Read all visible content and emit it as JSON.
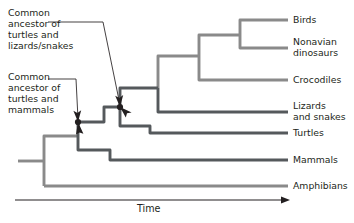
{
  "figure": {
    "background_color": "#ffffff",
    "text_color": "#231f20",
    "branch_color_light": "#8a8a8a",
    "branch_color_dark": "#55595c",
    "leader_color": "#231f20",
    "node_color": "#231f20"
  },
  "axis": {
    "label": "Time",
    "arrow_direction": "right",
    "x_start": 15,
    "x_end": 288,
    "y": 200
  },
  "tips": [
    {
      "name": "birds",
      "label": "Birds",
      "y": 20,
      "shade": "light"
    },
    {
      "name": "nonavian-dinosaurs",
      "label": "Nonavian\ndinosaurs",
      "y": 48,
      "shade": "light"
    },
    {
      "name": "crocodiles",
      "label": "Crocodiles",
      "y": 80,
      "shade": "light"
    },
    {
      "name": "lizards-and-snakes",
      "label": "Lizards\nand snakes",
      "y": 112,
      "shade": "dark"
    },
    {
      "name": "turtles",
      "label": "Turtles",
      "y": 133,
      "shade": "dark"
    },
    {
      "name": "mammals",
      "label": "Mammals",
      "y": 160,
      "shade": "dark"
    },
    {
      "name": "amphibians",
      "label": "Amphibians",
      "y": 186,
      "shade": "light"
    }
  ],
  "callouts": [
    {
      "name": "common-ancestor-turtles-lizards-snakes",
      "text": "Common\nancestor of\nturtles and\nlizards/snakes",
      "x": 8,
      "y": 8,
      "leader_y": 22,
      "leader_x_end": 103,
      "target_x": 120,
      "target_y": 107
    },
    {
      "name": "common-ancestor-turtles-mammals",
      "text": "Common\nancestor of\nturtles and\nmammals",
      "x": 8,
      "y": 72,
      "leader_y": 79,
      "leader_x_end": 76,
      "target_x": 78,
      "target_y": 122
    }
  ],
  "nodes": [
    {
      "name": "node-turtles-mammals",
      "x": 78,
      "y": 122
    },
    {
      "name": "node-turtles-lizards-snakes",
      "x": 120,
      "y": 107
    }
  ]
}
